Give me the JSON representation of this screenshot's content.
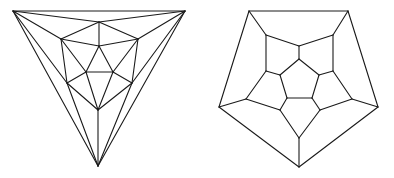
{
  "figures": [
    {
      "name": "icosahedron-schlegel",
      "stroke": "#1a1a1a",
      "vertices": {
        "TL": [
          13,
          11
        ],
        "TR": [
          185,
          11
        ],
        "B": [
          98,
          166
        ],
        "TM": [
          99,
          22
        ],
        "UL": [
          61,
          39
        ],
        "UR": [
          138,
          39
        ],
        "C": [
          99,
          46
        ],
        "IL": [
          86,
          72
        ],
        "IR": [
          113,
          72
        ],
        "LL": [
          67,
          83
        ],
        "LR": [
          132,
          83
        ],
        "IB": [
          98,
          110
        ]
      },
      "edges": [
        [
          "TL",
          "TR"
        ],
        [
          "TR",
          "B"
        ],
        [
          "B",
          "TL"
        ],
        [
          "TL",
          "TM"
        ],
        [
          "TL",
          "UL"
        ],
        [
          "TL",
          "LL"
        ],
        [
          "TR",
          "TM"
        ],
        [
          "TR",
          "UR"
        ],
        [
          "TR",
          "LR"
        ],
        [
          "B",
          "LL"
        ],
        [
          "B",
          "LR"
        ],
        [
          "B",
          "IB"
        ],
        [
          "TM",
          "UL"
        ],
        [
          "TM",
          "UR"
        ],
        [
          "TM",
          "C"
        ],
        [
          "UL",
          "C"
        ],
        [
          "UR",
          "C"
        ],
        [
          "UL",
          "LL"
        ],
        [
          "UR",
          "LR"
        ],
        [
          "UL",
          "IL"
        ],
        [
          "UR",
          "IR"
        ],
        [
          "C",
          "IL"
        ],
        [
          "C",
          "IR"
        ],
        [
          "IL",
          "IR"
        ],
        [
          "IL",
          "LL"
        ],
        [
          "IR",
          "LR"
        ],
        [
          "IL",
          "IB"
        ],
        [
          "IR",
          "IB"
        ],
        [
          "LL",
          "IB"
        ],
        [
          "LR",
          "IB"
        ]
      ]
    },
    {
      "name": "dodecahedron-schlegel",
      "stroke": "#1a1a1a",
      "vertices": {
        "O1": [
          249,
          11
        ],
        "O2": [
          348,
          11
        ],
        "O3": [
          378,
          107
        ],
        "O4": [
          299,
          167
        ],
        "O5": [
          219,
          107
        ],
        "M1": [
          266,
          35
        ],
        "M2": [
          333,
          35
        ],
        "M3": [
          352,
          99
        ],
        "M4": [
          299,
          138
        ],
        "M5": [
          246,
          99
        ],
        "N12": [
          299,
          46
        ],
        "N23": [
          333,
          71
        ],
        "N34": [
          320,
          110
        ],
        "N45": [
          280,
          110
        ],
        "N51": [
          266,
          71
        ],
        "I1": [
          299,
          59
        ],
        "I2": [
          319,
          75
        ],
        "I3": [
          312,
          98
        ],
        "I4": [
          287,
          98
        ],
        "I5": [
          280,
          75
        ]
      },
      "edges": [
        [
          "O1",
          "O2"
        ],
        [
          "O2",
          "O3"
        ],
        [
          "O3",
          "O4"
        ],
        [
          "O4",
          "O5"
        ],
        [
          "O5",
          "O1"
        ],
        [
          "O1",
          "M1"
        ],
        [
          "O2",
          "M2"
        ],
        [
          "O3",
          "M3"
        ],
        [
          "O4",
          "M4"
        ],
        [
          "O5",
          "M5"
        ],
        [
          "M1",
          "N12"
        ],
        [
          "N12",
          "M2"
        ],
        [
          "M2",
          "N23"
        ],
        [
          "N23",
          "M3"
        ],
        [
          "M3",
          "N34"
        ],
        [
          "N34",
          "M4"
        ],
        [
          "M4",
          "N45"
        ],
        [
          "N45",
          "M5"
        ],
        [
          "M5",
          "N51"
        ],
        [
          "N51",
          "M1"
        ],
        [
          "N12",
          "I1"
        ],
        [
          "N23",
          "I2"
        ],
        [
          "N34",
          "I3"
        ],
        [
          "N45",
          "I4"
        ],
        [
          "N51",
          "I5"
        ],
        [
          "I1",
          "I2"
        ],
        [
          "I2",
          "I3"
        ],
        [
          "I3",
          "I4"
        ],
        [
          "I4",
          "I5"
        ],
        [
          "I5",
          "I1"
        ]
      ]
    }
  ]
}
